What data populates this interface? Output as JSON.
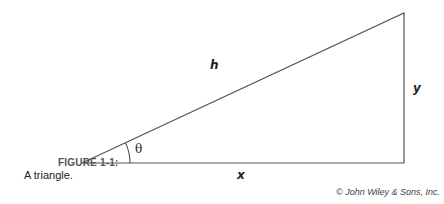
{
  "figure": {
    "caption_label": "FIGURE 1-1:",
    "caption_text": "A triangle.",
    "credit": "© John Wiley & Sons, Inc."
  },
  "diagram": {
    "shape": "right triangle",
    "labels": {
      "hypotenuse": "h",
      "opposite": "y",
      "adjacent": "x",
      "angle": "θ"
    },
    "vertices": {
      "angle_vertex": [
        82,
        163
      ],
      "right_angle_vertex": [
        404,
        163
      ],
      "top_vertex": [
        404,
        13
      ]
    },
    "line_color": "#555555"
  }
}
